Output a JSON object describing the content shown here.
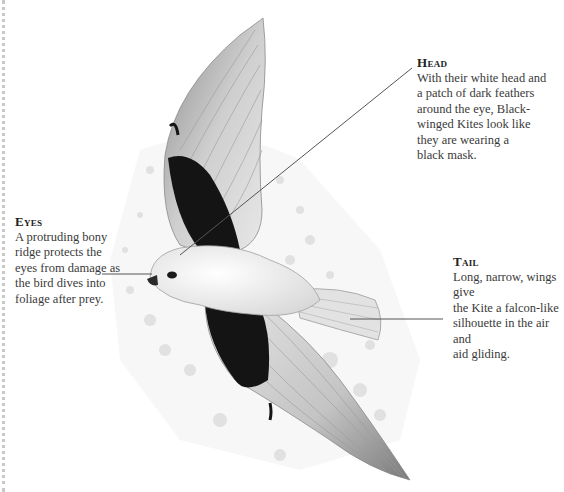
{
  "callouts": {
    "head": {
      "title": "Head",
      "body": "With their white head and\na patch of dark feathers\naround the eye, Black-\nwinged Kites look like\nthey are wearing a\nblack mask."
    },
    "eyes": {
      "title": "Eyes",
      "body": "A protruding bony\nridge protects the\neyes from damage as\nthe bird dives into\nfoliage after prey."
    },
    "tail": {
      "title": "Tail",
      "body": "Long, narrow, wings give\nthe Kite a falcon-like\nsilhouette in the air and\naid gliding."
    }
  },
  "illustration": {
    "subject": "black-winged-kite",
    "colors": {
      "line": "#555555",
      "wing_dark": "#141414",
      "feather": "#bdbdbd",
      "body": "#f2f2f2",
      "trees": "#d6d6d6"
    }
  }
}
